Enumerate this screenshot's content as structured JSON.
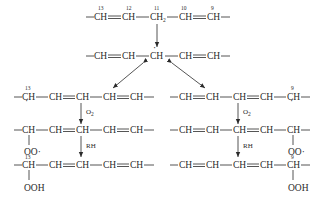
{
  "diagram": {
    "atom_label": "CH",
    "ch2_label": "CH",
    "ch2_sub": "2",
    "radical_dot": "·",
    "reagents": {
      "oxygen": "O",
      "oxygen_sub": "2",
      "hydrogen_donor": "RH"
    },
    "groups": {
      "peroxyl": "OO·",
      "hydroperoxide": "OOH"
    },
    "carbon_numbers": {
      "c13": "13",
      "c12": "12",
      "c11": "11",
      "c10": "10",
      "c9": "9"
    }
  }
}
